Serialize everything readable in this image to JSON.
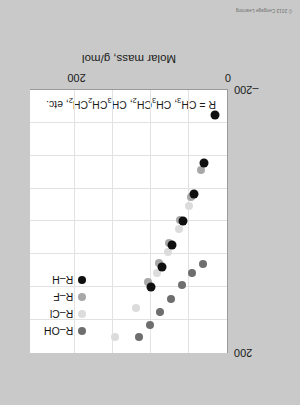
{
  "credit": "© 2013 Cengage Learning",
  "legend": {
    "position": "top-right",
    "items": [
      {
        "label": "R–OH",
        "color": "#6e6e6e",
        "name": "legend-item-r-oh"
      },
      {
        "label": "R–Cl",
        "color": "#dcdcdc",
        "name": "legend-item-r-cl"
      },
      {
        "label": "R–F",
        "color": "#a8a8a8",
        "name": "legend-item-r-f"
      },
      {
        "label": "R–H",
        "color": "#101010",
        "name": "legend-item-r-h"
      }
    ]
  },
  "note": {
    "prefix": "R = CH",
    "sub1": "3",
    "mid1": ", CH",
    "sub2": "3",
    "mid2": "CH",
    "sub3": "2",
    "mid3": ", CH",
    "sub4": "3",
    "mid4": "CH",
    "sub5": "2",
    "mid5": "CH",
    "sub6": "2",
    "suffix": ", etc.",
    "full": "R = CH3, CH3CH2, CH3CH2CH2, etc."
  },
  "chart_data": {
    "type": "scatter",
    "title": "",
    "xlabel": "Molar mass, g/mol",
    "ylabel": "Boiling point, °C",
    "xlim": [
      0,
      260
    ],
    "ylim": [
      -200,
      200
    ],
    "xticks": [
      0,
      200
    ],
    "xticklabels": [
      "0",
      "200"
    ],
    "yticks": [
      -200,
      200
    ],
    "yticklabels": [
      "–200",
      "200"
    ],
    "grid": true,
    "gridlines_x": [
      50,
      100,
      150,
      200
    ],
    "gridlines_y": [
      -150,
      -100,
      -50,
      0,
      50,
      100,
      150
    ],
    "series": [
      {
        "name": "R–OH",
        "color": "#6e6e6e",
        "points": [
          {
            "x": 32,
            "y": 65
          },
          {
            "x": 46,
            "y": 78
          },
          {
            "x": 60,
            "y": 97
          },
          {
            "x": 74,
            "y": 118
          },
          {
            "x": 88,
            "y": 138
          },
          {
            "x": 102,
            "y": 157
          },
          {
            "x": 116,
            "y": 176
          }
        ]
      },
      {
        "name": "R–Cl",
        "color": "#dcdcdc",
        "points": [
          {
            "x": 50,
            "y": -24
          },
          {
            "x": 64,
            "y": 12
          },
          {
            "x": 78,
            "y": 47
          },
          {
            "x": 92,
            "y": 78
          },
          {
            "x": 120,
            "y": 132
          },
          {
            "x": 148,
            "y": 175
          }
        ]
      },
      {
        "name": "R–F",
        "color": "#a8a8a8",
        "points": [
          {
            "x": 34,
            "y": -78
          },
          {
            "x": 48,
            "y": -37
          },
          {
            "x": 62,
            "y": -3
          },
          {
            "x": 76,
            "y": 32
          },
          {
            "x": 90,
            "y": 63
          },
          {
            "x": 104,
            "y": 92
          }
        ]
      },
      {
        "name": "R–H",
        "color": "#101010",
        "points": [
          {
            "x": 16,
            "y": -162
          },
          {
            "x": 30,
            "y": -89
          },
          {
            "x": 44,
            "y": -42
          },
          {
            "x": 58,
            "y": -1
          },
          {
            "x": 72,
            "y": 36
          },
          {
            "x": 86,
            "y": 69
          },
          {
            "x": 100,
            "y": 99
          }
        ]
      }
    ]
  }
}
